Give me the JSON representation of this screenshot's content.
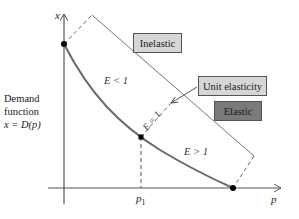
{
  "diagram": {
    "axes": {
      "x_axis_label": "p",
      "y_axis_label": "x",
      "x_tick_label": "p",
      "x_tick_subscript": "1"
    },
    "curve_label": {
      "line1": "Demand",
      "line2": "function",
      "line3": "x = D(p)"
    },
    "regions": {
      "inelastic_condition": "E < 1",
      "unit_condition": "E = 1",
      "elastic_condition": "E > 1"
    },
    "boxes": {
      "inelastic": {
        "label": "Inelastic",
        "fill": "#d6d6d6"
      },
      "unit": {
        "label": "Unit elasticity",
        "fill": "#d6d6d6"
      },
      "elastic": {
        "label": "Elastic",
        "fill": "#7a7a7a"
      }
    },
    "colors": {
      "axis": "#555555",
      "curve": "#666666",
      "outline": "#666666",
      "point": "#000000"
    }
  }
}
